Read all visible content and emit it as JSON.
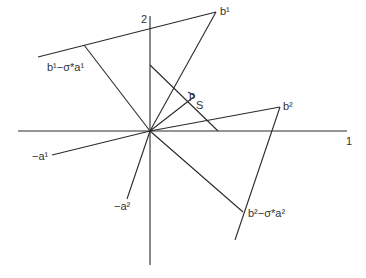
{
  "diagram": {
    "title": "",
    "axes": {
      "horizontal_label": "1",
      "vertical_label": "2"
    },
    "points": {
      "b1": {
        "label": "b¹"
      },
      "b2": {
        "label": "b²"
      },
      "b1_minus_sigma_a1": {
        "label": "b¹−σ*a¹"
      },
      "b2_minus_sigma_a2": {
        "label": "b²−σ*a²"
      },
      "neg_a1": {
        "label": "−a¹"
      },
      "neg_a2": {
        "label": "−a²"
      },
      "p": {
        "label": "p"
      },
      "S": {
        "label": "S"
      }
    },
    "colors": {
      "line": "#2a2a2a",
      "text": "#333333",
      "background": "#ffffff"
    }
  }
}
